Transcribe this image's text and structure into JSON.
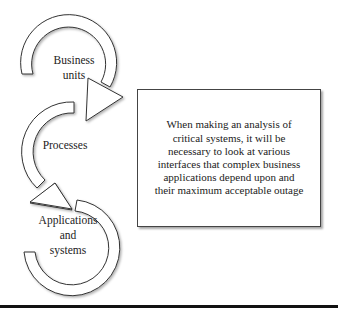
{
  "diagram": {
    "nodes": [
      {
        "id": "business-units",
        "lines": [
          "Business",
          "units"
        ]
      },
      {
        "id": "processes",
        "lines": [
          "Processes"
        ]
      },
      {
        "id": "applications-systems",
        "lines": [
          "Applications",
          "and",
          "systems"
        ]
      }
    ],
    "note": {
      "lines": [
        "When making an analysis of",
        "critical systems, it will be",
        "necessary to look at various",
        "interfaces that complex business",
        "applications depend upon and",
        "their maximum acceptable outage"
      ]
    },
    "colors": {
      "stroke": "#333333",
      "fill": "#ffffff",
      "rule": "#111111"
    }
  }
}
